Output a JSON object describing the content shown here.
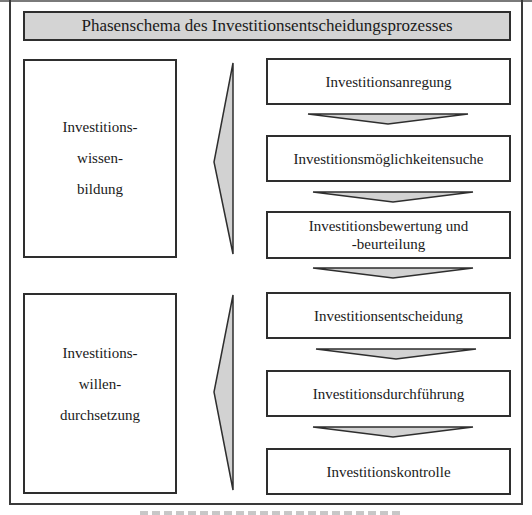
{
  "diagram": {
    "title": "Phasenschema des Investitionsentscheidungsprozesses",
    "groups": [
      {
        "label_lines": [
          "Investitions-",
          "wissen-",
          "bildung"
        ],
        "phases": [
          "Investitionsanregung",
          "Investitionsmöglichkeitensuche",
          "Investitionsbewertung und -beurteilung"
        ]
      },
      {
        "label_lines": [
          "Investitions-",
          "willen-",
          "durchsetzung"
        ],
        "phases": [
          "Investitionsentscheidung",
          "Investitionsdurchführung",
          "Investitionskontrolle"
        ]
      }
    ],
    "phase_boxes": [
      {
        "lines": [
          "Investitionsanregung"
        ]
      },
      {
        "lines": [
          "Investitionsmöglichkeitensuche"
        ]
      },
      {
        "lines": [
          "Investitionsbewertung und",
          "-beurteilung"
        ]
      },
      {
        "lines": [
          "Investitionsentscheidung"
        ]
      },
      {
        "lines": [
          "Investitionsdurchführung"
        ]
      },
      {
        "lines": [
          "Investitionskontrolle"
        ]
      }
    ],
    "colors": {
      "arrow_fill": "#d2d2d2",
      "title_fill": "#d4d4d4",
      "stroke": "#2e2e2e"
    }
  }
}
